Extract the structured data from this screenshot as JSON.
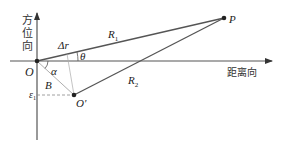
{
  "diagram": {
    "axes": {
      "vertical_label": [
        "方",
        "位",
        "向"
      ],
      "horizontal_label": "距离向"
    },
    "points": {
      "origin": {
        "label": "O",
        "x": 37,
        "y": 61
      },
      "target": {
        "label": "P",
        "x": 224,
        "y": 18
      },
      "offset": {
        "label": "O'",
        "x": 74,
        "y": 95
      }
    },
    "labels": {
      "R1": "R",
      "R1_sub": "1",
      "R2": "R",
      "R2_sub": "2",
      "delta_r": "Δr",
      "theta": "θ",
      "alpha": "α",
      "B": "B",
      "eps": "ε",
      "eps_sub": "1"
    },
    "colors": {
      "line": "#555555",
      "thin_line": "#999999",
      "dashed": "#888888",
      "point": "#222222"
    }
  }
}
